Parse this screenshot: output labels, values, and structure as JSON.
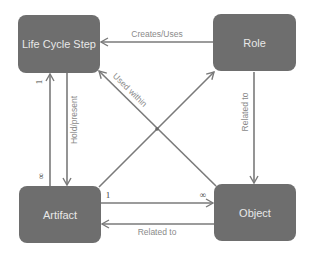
{
  "nodes": {
    "life_cycle_step": "Life Cycle Step",
    "role": "Role",
    "artifact": "Artifact",
    "object": "Object"
  },
  "edges": {
    "creates_uses": "Creates/Uses",
    "used_within": "Used within",
    "hold_present": "Hold/present",
    "related_to_vertical": "Related to",
    "related_to_horizontal": "Related to"
  },
  "multiplicity": {
    "lcs_artifact_top": "1",
    "lcs_artifact_bottom": "∞",
    "artifact_object_left": "1",
    "artifact_object_right": "∞"
  },
  "colors": {
    "node_fill": "#6e6e6e",
    "node_text": "#e8e8e8",
    "edge": "#7a7a7a",
    "label": "#8a8a8a"
  }
}
